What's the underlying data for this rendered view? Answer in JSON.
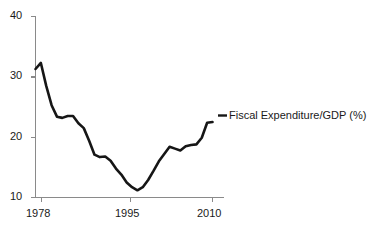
{
  "chart_data": {
    "type": "line",
    "title": "",
    "xlabel": "",
    "ylabel": "",
    "xlim": [
      1977,
      2010
    ],
    "ylim": [
      10,
      40
    ],
    "grid": false,
    "legend_position": "right-inline",
    "xticks": [
      "1978",
      "1995",
      "2010"
    ],
    "xtick_values": [
      1978,
      1995,
      2010
    ],
    "yticks": [
      "10",
      "20",
      "30",
      "40"
    ],
    "ytick_values": [
      10,
      20,
      30,
      40
    ],
    "series": [
      {
        "name": "Fiscal Expenditure/GDP (%)",
        "color": "#161616",
        "x": [
          1977,
          1978,
          1979,
          1980,
          1981,
          1982,
          1983,
          1984,
          1985,
          1986,
          1987,
          1988,
          1989,
          1990,
          1991,
          1992,
          1993,
          1994,
          1995,
          1996,
          1997,
          1998,
          1999,
          2000,
          2001,
          2002,
          2003,
          2004,
          2005,
          2006,
          2007,
          2008,
          2009,
          2010
        ],
        "values": [
          31.3,
          32.3,
          28.5,
          25.3,
          23.4,
          23.2,
          23.5,
          23.5,
          22.3,
          21.5,
          19.4,
          17.1,
          16.7,
          16.8,
          16.1,
          14.8,
          13.8,
          12.5,
          11.7,
          11.2,
          11.7,
          12.9,
          14.4,
          16.0,
          17.2,
          18.4,
          18.1,
          17.8,
          18.5,
          18.7,
          18.8,
          19.9,
          22.4,
          22.5
        ]
      }
    ],
    "annotations": []
  },
  "axis": {
    "y_tick_labels": [
      "40",
      "30",
      "20",
      "10"
    ],
    "x_tick_labels": [
      "1978",
      "1995",
      "2010"
    ]
  },
  "legend": {
    "label": "Fiscal Expenditure/GDP (%)"
  },
  "colors": {
    "line": "#161616",
    "axis": "#8a8a8a",
    "text": "#1a1a1a",
    "background": "#ffffff"
  }
}
